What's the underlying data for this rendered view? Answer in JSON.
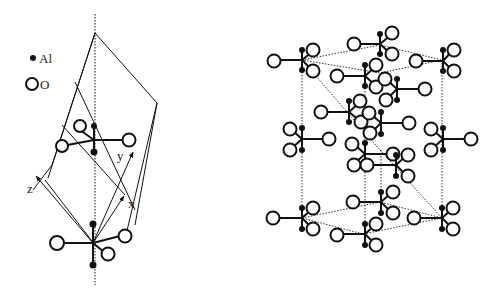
{
  "legend": {
    "items": [
      {
        "symbol": "filled-dot",
        "label": "Al"
      },
      {
        "symbol": "open-circle",
        "label": "O"
      }
    ]
  },
  "left_figure": {
    "axes": [
      {
        "label": "z"
      },
      {
        "label": "y"
      },
      {
        "label": "x"
      }
    ]
  },
  "colors": {
    "ink": "#111111",
    "background": "#ffffff"
  }
}
